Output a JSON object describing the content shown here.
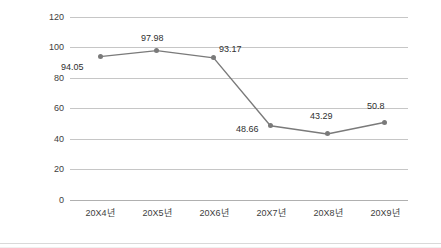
{
  "chart_data": {
    "type": "line",
    "title": "",
    "subtitle": "",
    "xlabel": "",
    "ylabel": "",
    "categories": [
      "20X4년",
      "20X5년",
      "20X6년",
      "20X7년",
      "20X8년",
      "20X9년"
    ],
    "values": [
      94.05,
      97.98,
      93.17,
      48.66,
      43.29,
      50.8
    ],
    "point_labels": [
      "94.05",
      "97.98",
      "93.17",
      "48.66",
      "43.29",
      "50.8"
    ],
    "ylim": [
      0,
      120
    ],
    "ytick_labels": [
      "120",
      "100",
      "80",
      "60",
      "40",
      "20",
      "0"
    ],
    "ytick_values": [
      120,
      100,
      80,
      60,
      40,
      20,
      0
    ],
    "grid": true,
    "grid_axis": "y",
    "legend": false,
    "legend_position": "none",
    "markers": true,
    "colors": {
      "line": "#7a7a7a",
      "marker": "#6e6e6e",
      "grid": "#c6c6c6",
      "axis": "#b0b0b0",
      "text": "#3d3d3d",
      "background": "#ffffff"
    }
  }
}
